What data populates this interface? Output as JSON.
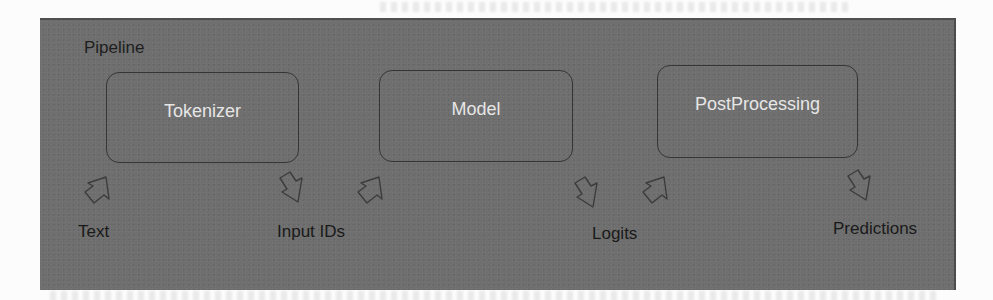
{
  "diagram": {
    "title": "Pipeline",
    "stages": [
      {
        "id": "tokenizer",
        "label": "Tokenizer"
      },
      {
        "id": "model",
        "label": "Model"
      },
      {
        "id": "postprocessing",
        "label": "PostProcessing"
      }
    ],
    "io_labels": {
      "text": "Text",
      "input_ids": "Input IDs",
      "logits": "Logits",
      "predictions": "Predictions"
    },
    "arrows": [
      {
        "from": "Text",
        "to": "Tokenizer",
        "direction": "up-right",
        "icon": "block-arrow-up-icon"
      },
      {
        "from": "Tokenizer",
        "to": "Input IDs",
        "direction": "down-right",
        "icon": "block-arrow-down-icon"
      },
      {
        "from": "Input IDs",
        "to": "Model",
        "direction": "up-right",
        "icon": "block-arrow-up-icon"
      },
      {
        "from": "Model",
        "to": "Logits",
        "direction": "down-right",
        "icon": "block-arrow-down-icon"
      },
      {
        "from": "Logits",
        "to": "PostProcessing",
        "direction": "up-right",
        "icon": "block-arrow-up-icon"
      },
      {
        "from": "PostProcessing",
        "to": "Predictions",
        "direction": "down-right",
        "icon": "block-arrow-down-icon"
      }
    ],
    "colors": {
      "panel_background": "#6f6f6f",
      "stage_border": "#353535",
      "stage_text": "#e6e6e6",
      "label_text": "#1a1a1a"
    }
  }
}
